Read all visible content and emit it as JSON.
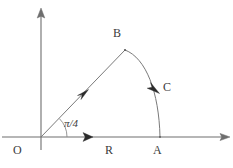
{
  "figure": {
    "background_color": "#ffffff",
    "line_color": "#7a7a7a",
    "axis_color": "#6e6e6e",
    "label_color": "#3b3b3b",
    "arrow_color": "#2b2b2b",
    "width": 233,
    "height": 168
  },
  "axes": {
    "vertical": {
      "name": "vertical-axis",
      "x": 41,
      "y_top": 10,
      "y_bottom": 150,
      "arrow": "up"
    },
    "horizontal": {
      "name": "horizontal-axis",
      "y": 137,
      "x_left": 2,
      "x_right": 228,
      "arrow": "right"
    }
  },
  "points": {
    "origin": {
      "label": "O",
      "x": 41,
      "y": 137
    },
    "a": {
      "label": "A",
      "x": 160,
      "y": 137
    },
    "b": {
      "label": "B",
      "x": 125,
      "y": 50
    },
    "c": {
      "label": "C",
      "x": 168,
      "y": 88
    },
    "r": {
      "label": "R",
      "x": 110,
      "y": 152
    }
  },
  "labels": {
    "origin": "O",
    "point_a": "A",
    "point_b": "B",
    "arc_c": "C",
    "radial_r": "R",
    "angle": "π/4"
  },
  "paths": {
    "ray_ob": {
      "name": "radial-ray",
      "from": [
        41,
        137
      ],
      "to": [
        125,
        50
      ],
      "angle_degrees": 45,
      "arrow_at": [
        82,
        96
      ],
      "arrow_direction": "up-right"
    },
    "arc_ba": {
      "name": "circular-arc",
      "from": [
        125,
        50
      ],
      "to": [
        160,
        137
      ],
      "arrow_at": [
        155,
        86
      ],
      "arrow_direction": "down-right"
    },
    "angle_marker": {
      "name": "angle-arc-marker",
      "center": [
        41,
        137
      ],
      "radius": 26,
      "start_degrees": 0,
      "end_degrees": 45
    },
    "r_arrow": {
      "name": "r-direction-arrow",
      "at": [
        88,
        137
      ],
      "direction": "right"
    }
  }
}
